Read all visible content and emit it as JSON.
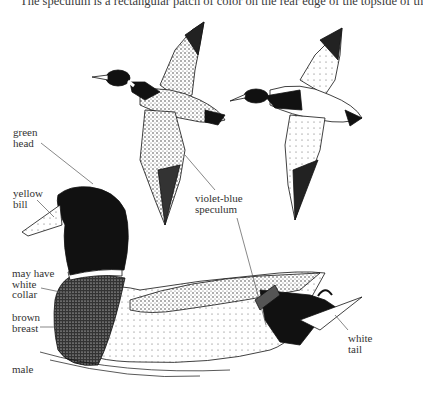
{
  "document": {
    "clipped_text_line": "The speculum is a rectangular patch of color on the rear edge of the topside of th"
  },
  "figure": {
    "illustrations": [
      "flying-duck-left",
      "flying-duck-right",
      "swimming-male-duck"
    ],
    "labels": {
      "green_head": [
        "green",
        "head"
      ],
      "yellow_bill": [
        "yellow",
        "bill"
      ],
      "speculum": [
        "violet-blue",
        "speculum"
      ],
      "collar": [
        "may have",
        "white",
        "collar"
      ],
      "breast": [
        "brown",
        "breast"
      ],
      "sex": "male",
      "tail": [
        "white",
        "tail"
      ]
    }
  }
}
